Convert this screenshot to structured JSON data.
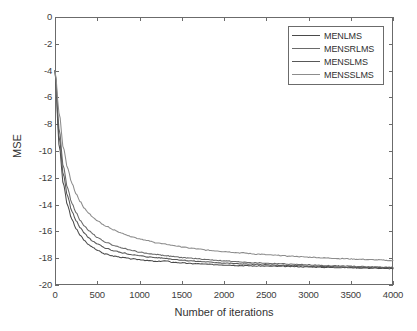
{
  "chart_data": {
    "type": "line",
    "title": "",
    "xlabel": "Number of iterations",
    "ylabel": "MSE",
    "xlim": [
      0,
      4000
    ],
    "ylim": [
      -20,
      0
    ],
    "xticks": [
      0,
      500,
      1000,
      1500,
      2000,
      2500,
      3000,
      3500,
      4000
    ],
    "yticks": [
      0,
      -2,
      -4,
      -6,
      -8,
      -10,
      -12,
      -14,
      -16,
      -18,
      -20
    ],
    "xtick_labels": [
      "0",
      "500",
      "1000",
      "1500",
      "2000",
      "2500",
      "3000",
      "3500",
      "4000"
    ],
    "ytick_labels": [
      "0",
      "-2",
      "-4",
      "-6",
      "-8",
      "-10",
      "-12",
      "-14",
      "-16",
      "-18",
      "-20"
    ],
    "grid": false,
    "legend_position": "upper right",
    "x": [
      0,
      50,
      100,
      150,
      200,
      250,
      300,
      350,
      400,
      450,
      500,
      600,
      700,
      800,
      900,
      1000,
      1100,
      1200,
      1300,
      1400,
      1500,
      1600,
      1700,
      1800,
      1900,
      2000,
      2200,
      2400,
      2600,
      2800,
      3000,
      3200,
      3400,
      3600,
      3800,
      4000
    ],
    "series": [
      {
        "name": "MENLMS",
        "color": "#4a4a4a",
        "values": [
          -4.0,
          -9.6,
          -12.5,
          -14.1,
          -15.1,
          -15.8,
          -16.3,
          -16.7,
          -17.0,
          -17.2,
          -17.4,
          -17.7,
          -17.85,
          -17.95,
          -18.05,
          -18.1,
          -18.18,
          -18.25,
          -18.2,
          -18.3,
          -18.35,
          -18.4,
          -18.42,
          -18.45,
          -18.48,
          -18.5,
          -18.55,
          -18.58,
          -18.6,
          -18.62,
          -18.65,
          -18.68,
          -18.7,
          -18.72,
          -18.75,
          -18.78
        ]
      },
      {
        "name": "MENSRLMS",
        "color": "#6a6a6a",
        "values": [
          -4.0,
          -8.4,
          -11.2,
          -12.8,
          -13.9,
          -14.6,
          -15.2,
          -15.6,
          -15.95,
          -16.2,
          -16.45,
          -16.8,
          -17.05,
          -17.25,
          -17.4,
          -17.55,
          -17.65,
          -17.72,
          -17.8,
          -17.88,
          -17.95,
          -18.0,
          -18.05,
          -18.1,
          -18.15,
          -18.2,
          -18.28,
          -18.35,
          -18.4,
          -18.45,
          -18.5,
          -18.55,
          -18.58,
          -18.62,
          -18.65,
          -18.68
        ]
      },
      {
        "name": "MENSLMS",
        "color": "#585858",
        "values": [
          -4.0,
          -9.0,
          -11.8,
          -13.4,
          -14.5,
          -15.2,
          -15.75,
          -16.15,
          -16.5,
          -16.75,
          -16.95,
          -17.25,
          -17.45,
          -17.6,
          -17.72,
          -17.82,
          -17.9,
          -17.96,
          -18.0,
          -18.08,
          -18.14,
          -18.2,
          -18.24,
          -18.28,
          -18.32,
          -18.36,
          -18.42,
          -18.47,
          -18.52,
          -18.56,
          -18.6,
          -18.63,
          -18.66,
          -18.68,
          -18.7,
          -18.72
        ]
      },
      {
        "name": "MENSSLMS",
        "color": "#8c8c8c",
        "values": [
          -4.0,
          -7.2,
          -9.8,
          -11.3,
          -12.4,
          -13.2,
          -13.8,
          -14.3,
          -14.65,
          -14.95,
          -15.2,
          -15.6,
          -15.9,
          -16.15,
          -16.38,
          -16.55,
          -16.7,
          -16.85,
          -16.95,
          -17.05,
          -17.15,
          -17.25,
          -17.32,
          -17.4,
          -17.45,
          -17.5,
          -17.6,
          -17.7,
          -17.78,
          -17.85,
          -17.92,
          -17.98,
          -18.03,
          -18.08,
          -18.12,
          -18.18
        ]
      }
    ]
  },
  "legend": {
    "items": [
      {
        "label": "MENLMS"
      },
      {
        "label": "MENSRLMS"
      },
      {
        "label": "MENSLMS"
      },
      {
        "label": "MENSSLMS"
      }
    ]
  },
  "axes": {
    "x_title": "Number of iterations",
    "y_title": "MSE"
  }
}
